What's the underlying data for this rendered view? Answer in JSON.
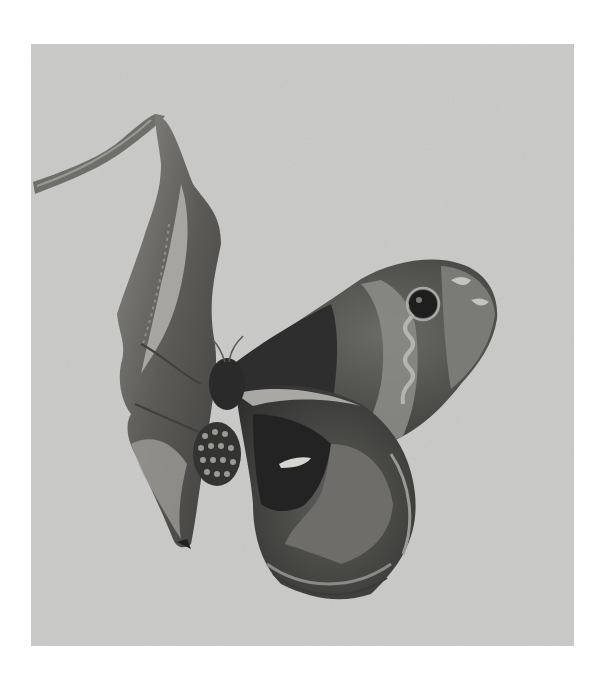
{
  "image": {
    "subject": "Moth resting beneath a dried curled leaf hanging from a twig",
    "style": "black-and-white photograph",
    "background_color": "#c9c9c7",
    "page_color": "#ffffff",
    "tones": {
      "wing_dark": "#2e2e2e",
      "wing_mid": "#5a5a58",
      "wing_light": "#8a8a86",
      "wing_pale_band": "#a9a8a4",
      "leaf_dark": "#4a4a48",
      "leaf_mid": "#7a7a76",
      "leaf_light": "#b3b2ad",
      "twig": "#6e6e6a"
    }
  }
}
